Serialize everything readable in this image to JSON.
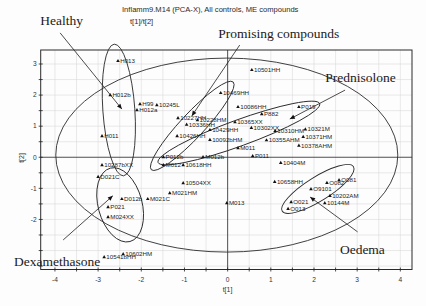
{
  "header": {
    "title": "Inflamm9.M14 (PCA-X), All controls, ME compounds",
    "subtitle": "t[1]/t[2]"
  },
  "chart_data": {
    "type": "scatter",
    "title": "Inflamm9.M14 (PCA-X), All controls, ME compounds",
    "subtitle": "t[1]/t[2]",
    "xlabel": "t[1]",
    "ylabel": "t[2]",
    "xlim": [
      -4.33,
      4.27
    ],
    "ylim": [
      -3.61,
      3.45
    ],
    "x_ticks": [
      -4,
      -3,
      -2,
      -1,
      0,
      1,
      2,
      3,
      4
    ],
    "y_ticks": [
      -2,
      -1,
      0,
      1,
      2,
      3
    ],
    "grid": true,
    "grid_step": 0.5,
    "marker": "triangle",
    "points": [
      {
        "label": "H013",
        "x": -2.54,
        "y": 3.1
      },
      {
        "label": "H012b",
        "x": -2.72,
        "y": 2.0
      },
      {
        "label": "H99",
        "x": -2.03,
        "y": 1.71
      },
      {
        "label": "H012a",
        "x": -2.1,
        "y": 1.52
      },
      {
        "label": "10245L",
        "x": -1.64,
        "y": 1.68
      },
      {
        "label": "H011",
        "x": -2.91,
        "y": 0.68
      },
      {
        "label": "10287bXX",
        "x": -2.91,
        "y": -0.25
      },
      {
        "label": "D021C",
        "x": -3.0,
        "y": -0.63
      },
      {
        "label": "D012b",
        "x": -2.45,
        "y": -1.34
      },
      {
        "label": "M021C",
        "x": -1.85,
        "y": -1.34
      },
      {
        "label": "M021HM",
        "x": -1.34,
        "y": -1.15
      },
      {
        "label": "P021",
        "x": -2.77,
        "y": -1.6
      },
      {
        "label": "M024XX",
        "x": -2.77,
        "y": -1.92
      },
      {
        "label": "10541bHH",
        "x": -2.86,
        "y": -3.21
      },
      {
        "label": "10602HM",
        "x": -2.42,
        "y": -3.11
      },
      {
        "label": "P012b",
        "x": -1.49,
        "y": 0.01
      },
      {
        "label": "M012",
        "x": -1.49,
        "y": -0.25
      },
      {
        "label": "10618HH",
        "x": -1.03,
        "y": -0.25
      },
      {
        "label": "M012b",
        "x": -0.57,
        "y": 0.01
      },
      {
        "label": "10504XX",
        "x": -1.03,
        "y": -0.83
      },
      {
        "label": "10658HH",
        "x": 1.09,
        "y": -0.79
      },
      {
        "label": "M013",
        "x": -0.02,
        "y": -1.47
      },
      {
        "label": "10404M",
        "x": 1.23,
        "y": -0.18
      },
      {
        "label": "P011",
        "x": 0.58,
        "y": 0.04
      },
      {
        "label": "M011",
        "x": 0.24,
        "y": 0.3
      },
      {
        "label": "10501HH",
        "x": 0.56,
        "y": 2.81
      },
      {
        "label": "10469HH",
        "x": -0.16,
        "y": 2.07
      },
      {
        "label": "P019",
        "x": 1.65,
        "y": 1.62
      },
      {
        "label": "P882",
        "x": 0.79,
        "y": 1.39
      },
      {
        "label": "10086HH",
        "x": 0.24,
        "y": 1.62
      },
      {
        "label": "10365XX",
        "x": 0.17,
        "y": 1.13
      },
      {
        "label": "10092bHM",
        "x": -0.41,
        "y": 0.56
      },
      {
        "label": "10426HH",
        "x": -1.17,
        "y": 0.68
      },
      {
        "label": "10227HH",
        "x": -1.15,
        "y": 1.26
      },
      {
        "label": "10429HH",
        "x": -0.41,
        "y": 0.88
      },
      {
        "label": "10321M",
        "x": 1.8,
        "y": 0.9
      },
      {
        "label": "10371HM",
        "x": 1.75,
        "y": 0.66
      },
      {
        "label": "10378AHM",
        "x": 1.65,
        "y": 0.38
      },
      {
        "label": "10336HH",
        "x": -0.95,
        "y": 1.05
      },
      {
        "label": "10228HM",
        "x": -0.7,
        "y": 1.2
      },
      {
        "label": "10355AHM",
        "x": 0.9,
        "y": 0.55
      },
      {
        "label": "10310HM",
        "x": 1.1,
        "y": 0.85
      },
      {
        "label": "10302XX",
        "x": 0.55,
        "y": 0.95
      },
      {
        "label": "O081",
        "x": 2.58,
        "y": -0.73
      },
      {
        "label": "O082",
        "x": 2.3,
        "y": -0.82
      },
      {
        "label": "O9101",
        "x": 1.93,
        "y": -1.02
      },
      {
        "label": "10202AM",
        "x": 2.37,
        "y": -1.24
      },
      {
        "label": "10144M",
        "x": 2.25,
        "y": -1.47
      },
      {
        "label": "O021",
        "x": 1.47,
        "y": -1.44
      },
      {
        "label": "O013",
        "x": 1.4,
        "y": -1.66
      }
    ],
    "ellipses": [
      {
        "name": "hotelling-t2-ellipse",
        "cx": -0.02,
        "cy": 0.07,
        "rx_px": 171,
        "ry_px": 97,
        "angle": 0
      },
      {
        "name": "healthy-group-ellipse",
        "cx": -2.52,
        "cy": 1.52,
        "rx_px": 16,
        "ry_px": 66,
        "angle": -4
      },
      {
        "name": "dexamethasone-group-ellipse",
        "cx": -2.49,
        "cy": -1.53,
        "rx_px": 22,
        "ry_px": 38,
        "angle": -15
      },
      {
        "name": "promising-compounds-ellipse",
        "cx": -0.82,
        "cy": 1.01,
        "rx_px": 60,
        "ry_px": 12,
        "angle": -47
      },
      {
        "name": "prednisolone-group-ellipse",
        "cx": 0.26,
        "cy": 0.78,
        "rx_px": 86,
        "ry_px": 13,
        "angle": -20
      },
      {
        "name": "oedema-group-ellipse",
        "cx": 2.09,
        "cy": -1.02,
        "rx_px": 42,
        "ry_px": 12,
        "angle": -32
      }
    ],
    "annotations": [
      {
        "text": "Healthy",
        "x": -4.34,
        "y": 4.25,
        "arrow_from": [
          -3.88,
          4.0
        ],
        "arrow_to": [
          -2.45,
          1.55
        ]
      },
      {
        "text": "Promising compounds",
        "x": -0.22,
        "y": 3.84,
        "arrow_from": [
          0.28,
          3.61
        ],
        "arrow_to": [
          -0.83,
          1.33
        ]
      },
      {
        "text": "Prednisolone",
        "x": 2.26,
        "y": 2.41,
        "arrow_from": [
          2.72,
          2.16
        ],
        "arrow_to": [
          1.44,
          1.23
        ]
      },
      {
        "text": "Dexamethasone",
        "x": -4.95,
        "y": -3.5,
        "arrow_from": [
          -3.81,
          -2.66
        ],
        "arrow_to": [
          -2.66,
          -1.24
        ]
      },
      {
        "text": "Oedema",
        "x": 2.6,
        "y": -3.11,
        "arrow_from": [
          3.01,
          -2.4
        ],
        "arrow_to": [
          1.91,
          -1.28
        ]
      }
    ]
  }
}
